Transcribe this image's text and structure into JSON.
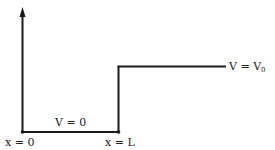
{
  "diagram": {
    "type": "potential-step",
    "labels": {
      "origin": "x = 0",
      "step_position": "x = L",
      "left_region": "V = 0",
      "right_region": "V = V",
      "right_region_subscript": "0"
    },
    "colors": {
      "line": "#1a1a1a",
      "background": "#ffffff"
    }
  }
}
